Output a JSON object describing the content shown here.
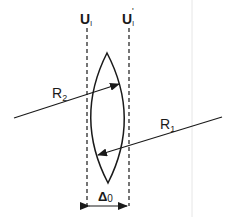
{
  "diagram": {
    "planes": {
      "left_label": "U",
      "left_sub": "l",
      "right_label": "U",
      "right_sub": "l",
      "right_prime": "'"
    },
    "rays": {
      "r2_label": "R",
      "r2_sub": "2",
      "r1_label": "R",
      "r1_sub": "1"
    },
    "thickness": {
      "label": "Δ",
      "sub": "0"
    },
    "colors": {
      "line": "#1a1a1a",
      "background": "#ffffff",
      "edge": "#e6e6e6"
    }
  }
}
